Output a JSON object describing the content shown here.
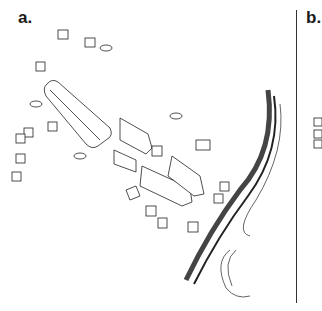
{
  "panels": [
    {
      "label": "a."
    },
    {
      "label": "b."
    }
  ],
  "illustration": {
    "description": "Line drawing of a settlement reconstruction with longhouses, small huts and animals next to a curved palisade/embankment along a river",
    "ink_color": "#222222",
    "background": "#ffffff"
  }
}
